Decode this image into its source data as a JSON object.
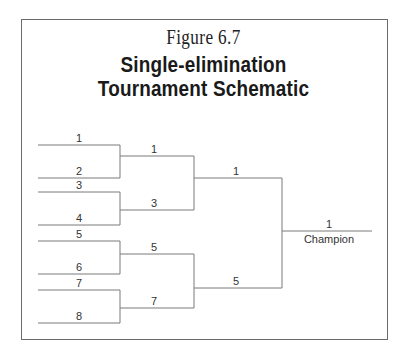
{
  "figure": {
    "label": "Figure 6.7",
    "title_line1": "Single-elimination",
    "title_line2": "Tournament Schematic"
  },
  "bracket": {
    "round1": [
      "1",
      "2",
      "3",
      "4",
      "5",
      "6",
      "7",
      "8"
    ],
    "round2": [
      "1",
      "3",
      "5",
      "7"
    ],
    "round3": [
      "1",
      "5"
    ],
    "final": "1",
    "champion_label": "Champion"
  }
}
